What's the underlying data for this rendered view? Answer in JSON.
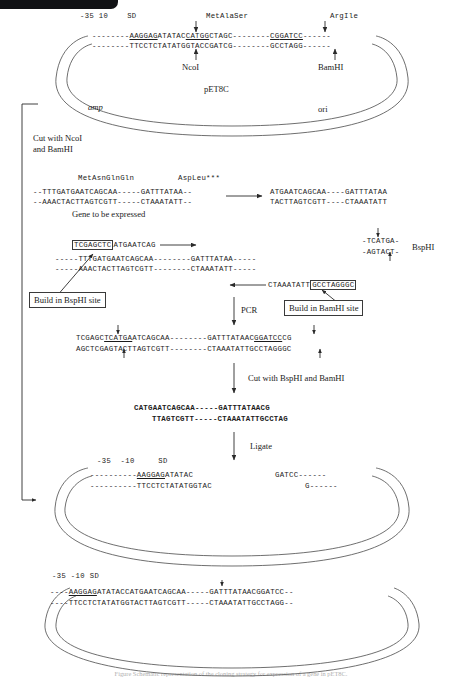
{
  "figure": {
    "title_bar": "",
    "caption": "Figure  Schematic representation of the cloning strategy for expression of a gene in pET8C."
  },
  "plasmid_top": {
    "name": "pET8C",
    "marker_left": "amp",
    "marker_right": "ori",
    "ruler": "-35 10    SD",
    "aa_left": "MetAlaSer",
    "aa_right": "ArgIle",
    "top_strand_pre": "--------",
    "top_strand": "AAGGAGATATACCATGGCTAGC--------CGGATCC------",
    "bottom_strand": "--------TTCCTCTATATGGTACCGATCG--------GCCTAGG------",
    "enzyme_left": "NcoI",
    "enzyme_right": "BamHI",
    "seg_a": "--------",
    "seg_b": "AAGGAG",
    "seg_c": "ATATAC",
    "seg_d": "CATGG",
    "seg_e": "CTAGC--------",
    "seg_f": "CG",
    "seg_g": "GATCC",
    "seg_h": "------",
    "bot_a": "--------TTCCTCTATATGGTAC",
    "bot_b": "CGATCG--------",
    "bot_c": "GCCTAGG",
    "bot_d": "------"
  },
  "step_cut_top": {
    "line1": "Cut with NcoI",
    "line2": "and BamHI"
  },
  "gene": {
    "aa_left": "MetAsnGlnGln",
    "aa_right": "AspLeu***",
    "top_strand": "--TTTGATGAATCAGCAA-----GATTTATAA--",
    "bottom_strand": "--AAACTACTTAGTCGTT-----CTAAATATT--",
    "label": "Gene to be expressed",
    "excised_top": "ATGAATCAGCAA----GATTTATAA",
    "excised_bottom": "TACTTAGTCGTT----CTAAATATT"
  },
  "primers": {
    "forward_boxed": "TCGAGCTC",
    "forward_tail": "ATGAATCAG",
    "template_top": "-----TTTGATGAATCAGCAA--------GATTTATAA-----",
    "template_bottom": "-----AAACTACTTAGTCGTT--------CTAAATATT-----",
    "reverse_tail": "CTAAATATT",
    "reverse_boxed": "GCCTAGGGC",
    "bsph_top": "-TCATGA-",
    "bsph_bottom": "-AGTACT-",
    "bsph_name": "BspHI",
    "callout_bsph": "Build in BspHI site",
    "callout_bamh": "Build in BamHI site",
    "pcr_label": "PCR"
  },
  "pcr_product": {
    "top_a": "TCGAGC",
    "top_b": "TCATGA",
    "top_c": "ATCAGCAA--------GATTTATAAC",
    "top_d": "GGATCC",
    "top_e": "CG",
    "bottom": "AGCTCGAGTACTTAGTCGTT--------CTAAATATTGCCTAGGGC",
    "cut_label": "Cut with BspHI and BamHI"
  },
  "cut_fragment": {
    "top": "CATGAATCAGCAA-----GATTTATAACG",
    "bottom": "TTAGTCGTT-----CTAAATATTGCCTAG",
    "ligate_label": "Ligate"
  },
  "plasmid_mid": {
    "ruler": "-35  -10     SD",
    "top_left_dashes": "----------",
    "top_sd": "AAGGAG",
    "top_rest": "ATATAC",
    "top_right": "GATCC------",
    "bottom_left": "----------TTCCTCTATATGGTAC",
    "bottom_right": "G------"
  },
  "plasmid_bottom": {
    "ruler": "-35 -10 SD",
    "top_dashes": "----",
    "top_sd": "AAGGAG",
    "top_spacer": "ATATAC",
    "top_insert": "CATGAATCAGCAA-----GATTTATAACGG",
    "top_tail": "ATCC--",
    "bot_dashes": "----",
    "bot_spacer": "TTCCTCTATATGGTAC",
    "bot_insert": "TTAGTCGTT-----CTAAATATTGCCTAG",
    "bot_tail": "G--"
  }
}
